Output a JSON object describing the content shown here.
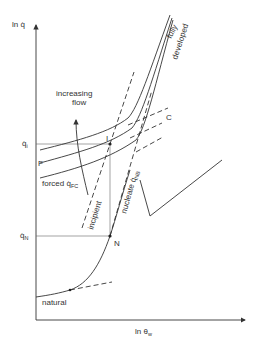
{
  "axes": {
    "y_label": "ln q̇",
    "x_label_main": "ln θ",
    "x_label_sub": "w"
  },
  "levels": {
    "q_i_main": "q̇",
    "q_i_sub": "i",
    "q_n_main": "q̇",
    "q_n_sub": "N"
  },
  "labels": {
    "increasing_line1": "increasing",
    "increasing_line2": "flow",
    "fully": "fully",
    "developed": "developed",
    "forced_main": "forced q̇",
    "forced_sub": "FC",
    "incipient": "incipient",
    "nucleate_main": "nucleate q̇",
    "nucleate_sub": "NB",
    "natural": "natural",
    "point_F": "F",
    "point_C": "C",
    "point_I": "I",
    "point_N": "N"
  }
}
